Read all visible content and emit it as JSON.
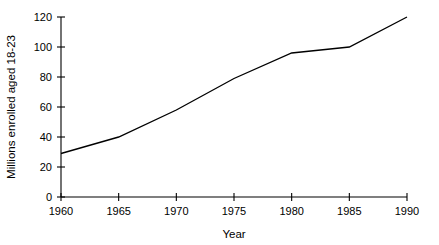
{
  "chart_data": {
    "type": "line",
    "title": "",
    "subtitle": "",
    "xlabel": "Year",
    "ylabel": "Millions enrolled aged 18-23",
    "x": [
      1960,
      1965,
      1970,
      1975,
      1980,
      1985,
      1990
    ],
    "values": [
      29,
      40,
      58,
      79,
      96,
      100,
      120
    ],
    "series": [
      {
        "name": "Millions enrolled aged 18-23",
        "values": [
          29,
          40,
          58,
          79,
          96,
          100,
          120
        ]
      }
    ],
    "xticks": [
      1960,
      1965,
      1970,
      1975,
      1980,
      1985,
      1990
    ],
    "xtick_labels": [
      "1960",
      "1965",
      "1970",
      "1975",
      "1980",
      "1985",
      "1990"
    ],
    "yticks": [
      0,
      20,
      40,
      60,
      80,
      100,
      120
    ],
    "ytick_labels": [
      "0",
      "20",
      "40",
      "60",
      "80",
      "100",
      "120"
    ],
    "xlim": [
      1960,
      1990
    ],
    "ylim": [
      0,
      120
    ],
    "grid": false,
    "legend": false,
    "legend_position": "none",
    "line_color": "#000000",
    "background_color": "#ffffff",
    "markers": false,
    "annotations": []
  },
  "axis_labels": {
    "x_title": "Year",
    "y_title": "Millions enrolled aged 18-23"
  }
}
